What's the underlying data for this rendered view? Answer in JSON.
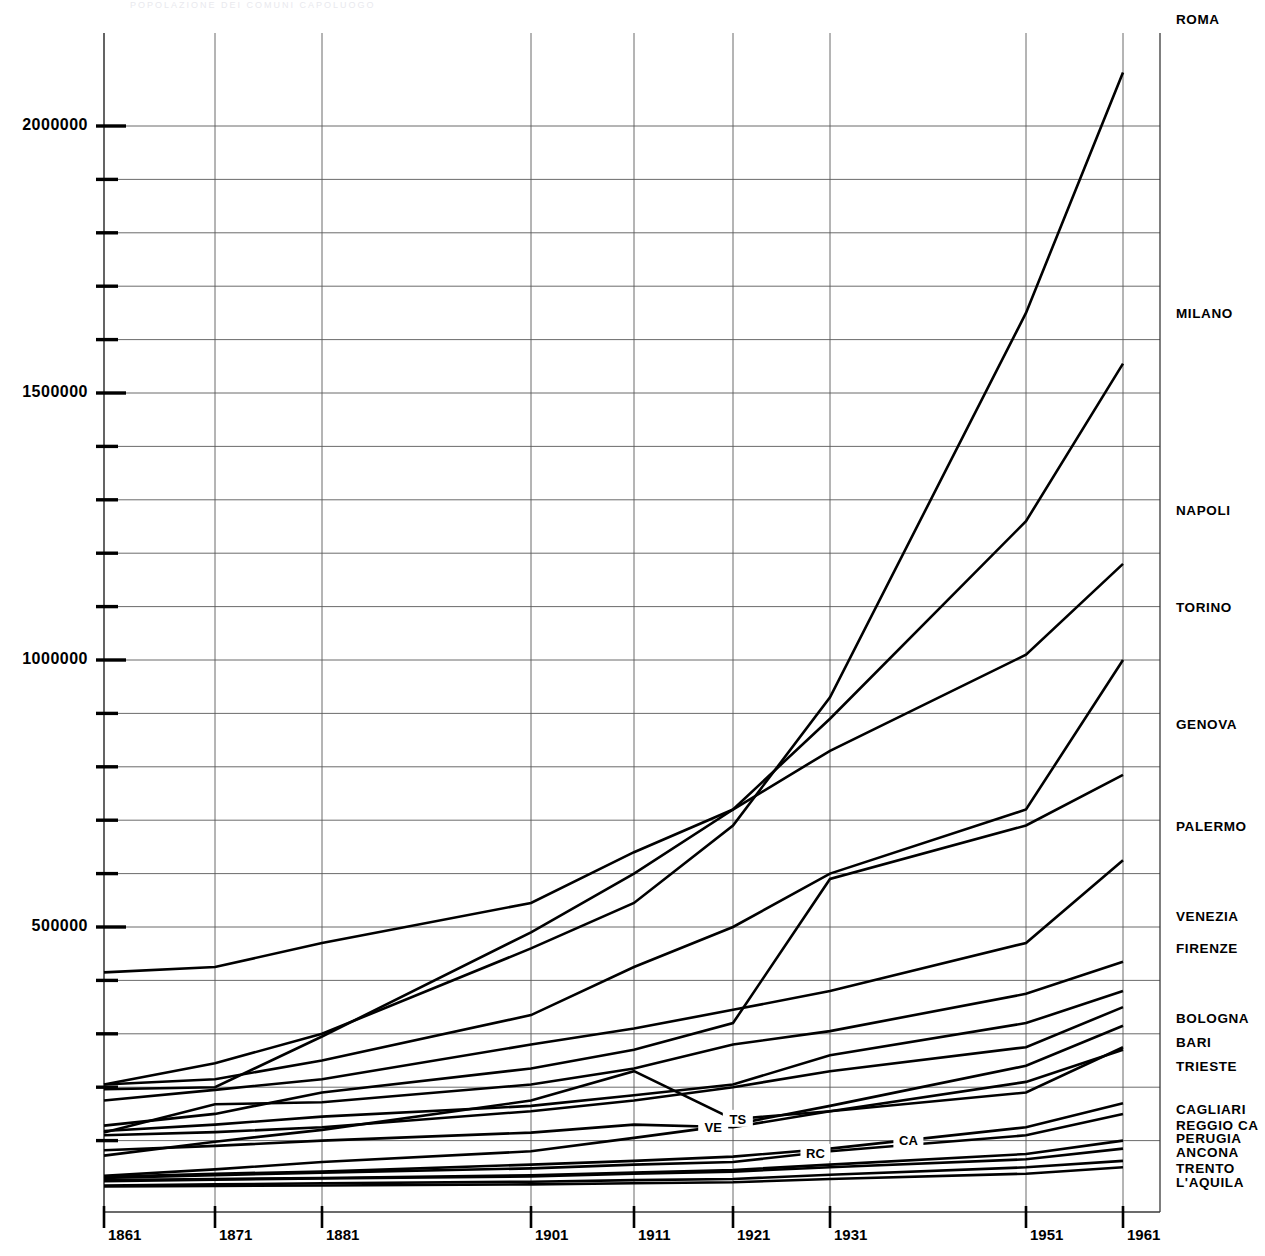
{
  "chart_data": {
    "type": "line",
    "title": "",
    "xlabel": "",
    "ylabel": "",
    "x": [
      1861,
      1871,
      1881,
      1901,
      1911,
      1921,
      1931,
      1951,
      1961
    ],
    "xtick_labels": [
      "1861",
      "1871",
      "1881",
      "1901",
      "1911",
      "1921",
      "1931",
      "1951",
      "1961"
    ],
    "ytick_labels": [
      "500000",
      "1000000",
      "1500000",
      "2000000"
    ],
    "ytick_values": [
      500000,
      1000000,
      1500000,
      2000000
    ],
    "yminor_values": [
      100000,
      200000,
      300000,
      400000,
      600000,
      700000,
      800000,
      900000,
      1100000,
      1200000,
      1300000,
      1400000,
      1600000,
      1700000,
      1800000,
      1900000
    ],
    "ylim": [
      0,
      2200000
    ],
    "xlim": [
      1861,
      1961
    ],
    "grid": true,
    "legend_position": "right-of-axes",
    "series": [
      {
        "name": "ROMA",
        "label": "ROMA",
        "label_y": 2200000,
        "values": [
          205000,
          245000,
          300000,
          460000,
          545000,
          690000,
          930000,
          1650000,
          2100000
        ]
      },
      {
        "name": "MILANO",
        "label": "MILANO",
        "label_y": 1650000,
        "values": [
          196000,
          200000,
          295000,
          490000,
          600000,
          720000,
          890000,
          1260000,
          1555000
        ]
      },
      {
        "name": "NAPOLI",
        "label": "NAPOLI",
        "label_y": 1280000,
        "values": [
          415000,
          425000,
          470000,
          545000,
          640000,
          720000,
          830000,
          1010000,
          1180000
        ]
      },
      {
        "name": "TORINO",
        "label": "TORINO",
        "label_y": 1100000,
        "values": [
          205000,
          215000,
          250000,
          335000,
          425000,
          500000,
          600000,
          720000,
          1000000
        ]
      },
      {
        "name": "GENOVA",
        "label": "GENOVA",
        "label_y": 880000,
        "values": [
          128000,
          150000,
          190000,
          235000,
          270000,
          320000,
          590000,
          690000,
          785000
        ]
      },
      {
        "name": "PALERMO",
        "label": "PALERMO",
        "label_y": 690000,
        "values": [
          175000,
          195000,
          215000,
          280000,
          310000,
          345000,
          380000,
          470000,
          625000
        ]
      },
      {
        "name": "VENEZIA",
        "label": "VENEZIA",
        "label_y": 520000,
        "values": [
          118000,
          130000,
          145000,
          165000,
          185000,
          205000,
          260000,
          320000,
          380000
        ]
      },
      {
        "name": "FIRENZE",
        "label": "FIRENZE",
        "label_y": 460000,
        "values": [
          115000,
          168000,
          172000,
          205000,
          235000,
          280000,
          305000,
          375000,
          435000
        ]
      },
      {
        "name": "BOLOGNA",
        "label": "BOLOGNA",
        "label_y": 330000,
        "values": [
          110000,
          116000,
          125000,
          155000,
          175000,
          200000,
          230000,
          275000,
          350000
        ]
      },
      {
        "name": "BARI",
        "label": "BARI",
        "label_y": 285000,
        "values": [
          34000,
          46000,
          60000,
          80000,
          105000,
          130000,
          165000,
          240000,
          315000
        ]
      },
      {
        "name": "TRIESTE",
        "label": "TRIESTE",
        "label_y": 240000,
        "values": [
          72000,
          98000,
          120000,
          175000,
          230000,
          140000,
          155000,
          190000,
          275000
        ],
        "inline_label": "TS",
        "inline_label_x": 1921.5
      },
      {
        "name": "VENEZIA-ALT",
        "label": "",
        "label_y": null,
        "values": [
          82000,
          90000,
          100000,
          115000,
          130000,
          125000,
          155000,
          210000,
          270000
        ],
        "inline_label": "VE",
        "inline_label_x": 1919.0
      },
      {
        "name": "CAGLIARI",
        "label": "CAGLIARI",
        "label_y": 160000,
        "values": [
          32000,
          38000,
          42000,
          55000,
          62000,
          70000,
          85000,
          125000,
          170000
        ],
        "inline_label": "CA",
        "inline_label_x": 1939.0
      },
      {
        "name": "REGGIO CALABRIA",
        "label": "REGGIO CA",
        "label_y": 130000,
        "values": [
          30000,
          35000,
          40000,
          48000,
          55000,
          60000,
          80000,
          110000,
          150000
        ],
        "inline_label": "RC",
        "inline_label_x": 1929.5
      },
      {
        "name": "PERUGIA",
        "label": "PERUGIA",
        "label_y": 105000,
        "values": [
          26000,
          28000,
          30000,
          35000,
          40000,
          45000,
          55000,
          75000,
          100000
        ]
      },
      {
        "name": "ANCONA",
        "label": "ANCONA",
        "label_y": 78000,
        "values": [
          24000,
          27000,
          29000,
          33000,
          38000,
          42000,
          50000,
          65000,
          85000
        ]
      },
      {
        "name": "TRENTO",
        "label": "TRENTO",
        "label_y": 48000,
        "values": [
          16000,
          18000,
          20000,
          23000,
          26000,
          28000,
          36000,
          50000,
          62000
        ]
      },
      {
        "name": "L'AQUILA",
        "label": "L'AQUILA",
        "label_y": 22000,
        "values": [
          14000,
          15000,
          16000,
          18000,
          20000,
          22000,
          28000,
          38000,
          50000
        ]
      }
    ]
  },
  "top_strip": {
    "text": "POPOLAZIONE DEI COMUNI CAPOLUOGO"
  }
}
